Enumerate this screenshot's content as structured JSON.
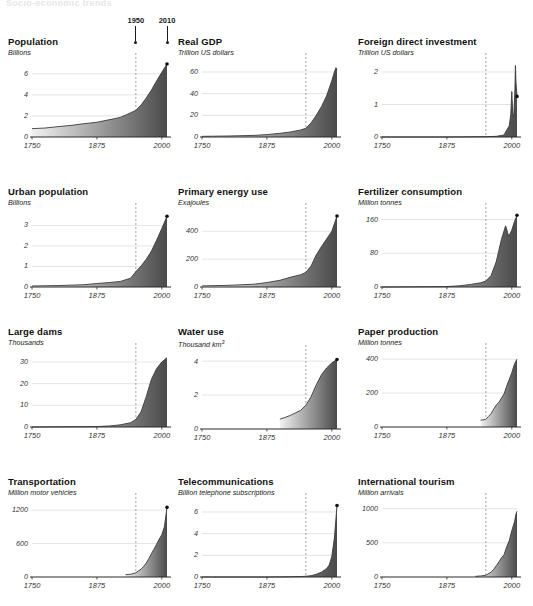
{
  "header": {
    "title": "Socio-economic trends"
  },
  "era_markers": [
    {
      "label": "1950",
      "year": 1950
    },
    {
      "label": "2010",
      "year": 2010
    }
  ],
  "axis": {
    "x_ticks": [
      "1750",
      "1875",
      "2000"
    ],
    "x_tick_values": [
      1750,
      1875,
      2000
    ],
    "x_range": [
      1750,
      2010
    ],
    "dashed_marker_year": 1950
  },
  "chart_data": [
    {
      "type": "area",
      "title": "Population",
      "ylabel": "Billions",
      "xlabel": "",
      "ylim": [
        0,
        7.4
      ],
      "y_ticks": [
        0,
        2,
        4,
        6
      ],
      "y_tick_labels": [
        "0",
        "2",
        "4",
        "6"
      ],
      "xlim": [
        1750,
        2010
      ],
      "x_ticks": [
        1750,
        1875,
        2000
      ],
      "x_tick_labels": [
        "1750",
        "1875",
        "2000"
      ],
      "grid": true,
      "end_dot": true,
      "x": [
        1750,
        1775,
        1800,
        1825,
        1850,
        1875,
        1900,
        1910,
        1920,
        1930,
        1940,
        1950,
        1960,
        1970,
        1980,
        1990,
        2000,
        2010
      ],
      "values": [
        0.79,
        0.85,
        0.98,
        1.1,
        1.26,
        1.4,
        1.65,
        1.75,
        1.86,
        2.07,
        2.3,
        2.53,
        3.03,
        3.7,
        4.45,
        5.32,
        6.14,
        6.93
      ]
    },
    {
      "type": "area",
      "title": "Real GDP",
      "ylabel": "Trillion US dollars",
      "xlabel": "",
      "ylim": [
        0,
        72
      ],
      "y_ticks": [
        0,
        20,
        40,
        60
      ],
      "y_tick_labels": [
        "0",
        "20",
        "40",
        "60"
      ],
      "xlim": [
        1750,
        2010
      ],
      "x_ticks": [
        1750,
        1875,
        2000
      ],
      "x_tick_labels": [
        "1750",
        "1875",
        "2000"
      ],
      "grid": true,
      "end_dot": false,
      "x": [
        1750,
        1800,
        1850,
        1875,
        1900,
        1920,
        1940,
        1950,
        1960,
        1970,
        1980,
        1990,
        2000,
        2005,
        2008,
        2010
      ],
      "values": [
        0.6,
        0.9,
        1.5,
        2.2,
        3.4,
        4.6,
        6.5,
        8.0,
        13.0,
        20.0,
        28.0,
        38.0,
        52.0,
        60.0,
        64.0,
        62.0
      ]
    },
    {
      "type": "area",
      "title": "Foreign direct investment",
      "ylabel": "Trillion US dollars",
      "xlabel": "",
      "ylim": [
        0,
        2.4
      ],
      "y_ticks": [
        0,
        1,
        2
      ],
      "y_tick_labels": [
        "0",
        "1",
        "2"
      ],
      "xlim": [
        1750,
        2010
      ],
      "x_ticks": [
        1750,
        1875,
        2000
      ],
      "x_tick_labels": [
        "1750",
        "1875",
        "2000"
      ],
      "grid": true,
      "end_dot": true,
      "x": [
        1750,
        1875,
        1950,
        1970,
        1980,
        1985,
        1990,
        1995,
        1998,
        2000,
        2002,
        2004,
        2006,
        2007,
        2008,
        2010
      ],
      "values": [
        0,
        0,
        0.01,
        0.02,
        0.05,
        0.06,
        0.21,
        0.34,
        0.69,
        1.4,
        0.62,
        0.73,
        1.46,
        2.2,
        1.7,
        1.25
      ]
    },
    {
      "type": "area",
      "title": "Urban population",
      "ylabel": "Billions",
      "xlabel": "",
      "ylim": [
        0,
        3.8
      ],
      "y_ticks": [
        0,
        1,
        2,
        3
      ],
      "y_tick_labels": [
        "0",
        "1",
        "2",
        "3"
      ],
      "xlim": [
        1750,
        2010
      ],
      "x_ticks": [
        1750,
        1875,
        2000
      ],
      "x_tick_labels": [
        "1750",
        "1875",
        "2000"
      ],
      "grid": true,
      "end_dot": true,
      "x": [
        1750,
        1800,
        1850,
        1875,
        1900,
        1920,
        1940,
        1950,
        1960,
        1970,
        1980,
        1990,
        2000,
        2010
      ],
      "values": [
        0.05,
        0.07,
        0.11,
        0.17,
        0.22,
        0.27,
        0.43,
        0.75,
        1.02,
        1.35,
        1.75,
        2.28,
        2.85,
        3.45
      ]
    },
    {
      "type": "area",
      "title": "Primary energy use",
      "ylabel": "Exajoules",
      "xlabel": "",
      "ylim": [
        0,
        560
      ],
      "y_ticks": [
        0,
        200,
        400
      ],
      "y_tick_labels": [
        "0",
        "200",
        "400"
      ],
      "xlim": [
        1750,
        2010
      ],
      "x_ticks": [
        1750,
        1875,
        2000
      ],
      "x_tick_labels": [
        "1750",
        "1875",
        "2000"
      ],
      "grid": true,
      "end_dot": true,
      "x": [
        1750,
        1800,
        1850,
        1875,
        1900,
        1920,
        1940,
        1950,
        1960,
        1970,
        1980,
        1990,
        2000,
        2005,
        2010
      ],
      "values": [
        8,
        12,
        20,
        32,
        48,
        70,
        88,
        105,
        150,
        230,
        290,
        345,
        400,
        455,
        510
      ]
    },
    {
      "type": "area",
      "title": "Fertilizer consumption",
      "ylabel": "Million tonnes",
      "xlabel": "",
      "ylim": [
        0,
        185
      ],
      "y_ticks": [
        0,
        80,
        160
      ],
      "y_tick_labels": [
        "0",
        "80",
        "160"
      ],
      "xlim": [
        1750,
        2010
      ],
      "x_ticks": [
        1750,
        1875,
        2000
      ],
      "x_tick_labels": [
        "1750",
        "1875",
        "2000"
      ],
      "grid": true,
      "end_dot": true,
      "x": [
        1750,
        1875,
        1900,
        1920,
        1940,
        1950,
        1960,
        1970,
        1980,
        1988,
        1990,
        1994,
        2000,
        2005,
        2010
      ],
      "values": [
        0,
        1,
        3,
        6,
        10,
        14,
        27,
        60,
        113,
        145,
        138,
        120,
        135,
        155,
        170
      ]
    },
    {
      "type": "area",
      "title": "Large dams",
      "ylabel": "Thousands",
      "xlabel": "",
      "ylim": [
        0,
        36
      ],
      "y_ticks": [
        0,
        10,
        20,
        30
      ],
      "y_tick_labels": [
        "0",
        "10",
        "20",
        "30"
      ],
      "xlim": [
        1750,
        2010
      ],
      "x_ticks": [
        1750,
        1875,
        2000
      ],
      "x_tick_labels": [
        "1750",
        "1875",
        "2000"
      ],
      "grid": true,
      "end_dot": false,
      "x": [
        1750,
        1875,
        1900,
        1920,
        1940,
        1950,
        1960,
        1970,
        1980,
        1990,
        2000,
        2010
      ],
      "values": [
        0,
        0.2,
        0.5,
        1.0,
        2.0,
        3.5,
        7.0,
        14.0,
        22.0,
        27.0,
        30.0,
        32.0
      ]
    },
    {
      "type": "area",
      "title": "Water use",
      "ylabel": "Thousand km³",
      "xlabel": "",
      "ylim": [
        0,
        4.6
      ],
      "y_ticks": [
        0,
        2,
        4
      ],
      "y_tick_labels": [
        "0",
        "2",
        "4"
      ],
      "xlim": [
        1750,
        2010
      ],
      "x_ticks": [
        1750,
        1875,
        2000
      ],
      "x_tick_labels": [
        "1750",
        "1875",
        "2000"
      ],
      "grid": true,
      "end_dot": true,
      "x": [
        1900,
        1910,
        1920,
        1930,
        1940,
        1950,
        1960,
        1970,
        1980,
        1990,
        2000,
        2010
      ],
      "values": [
        0.58,
        0.68,
        0.8,
        0.95,
        1.1,
        1.4,
        1.9,
        2.6,
        3.2,
        3.6,
        3.9,
        4.1
      ]
    },
    {
      "type": "area",
      "title": "Paper production",
      "ylabel": "Million tonnes",
      "xlabel": "",
      "ylim": [
        0,
        460
      ],
      "y_ticks": [
        0,
        200,
        400
      ],
      "y_tick_labels": [
        "0",
        "200",
        "400"
      ],
      "xlim": [
        1750,
        2010
      ],
      "x_ticks": [
        1750,
        1875,
        2000
      ],
      "x_tick_labels": [
        "1750",
        "1875",
        "2000"
      ],
      "grid": true,
      "end_dot": false,
      "x": [
        1940,
        1950,
        1955,
        1960,
        1965,
        1970,
        1975,
        1980,
        1985,
        1990,
        1995,
        2000,
        2005,
        2010
      ],
      "values": [
        40,
        45,
        62,
        78,
        105,
        130,
        145,
        170,
        195,
        240,
        280,
        320,
        370,
        400
      ]
    },
    {
      "type": "area",
      "title": "Transportation",
      "ylabel": "Million motor vehicles",
      "xlabel": "",
      "ylim": [
        0,
        1400
      ],
      "y_ticks": [
        0,
        600,
        1200
      ],
      "y_tick_labels": [
        "0",
        "600",
        "1200"
      ],
      "xlim": [
        1750,
        2010
      ],
      "x_ticks": [
        1750,
        1875,
        2000
      ],
      "x_tick_labels": [
        "1750",
        "1875",
        "2000"
      ],
      "grid": true,
      "end_dot": true,
      "x": [
        1930,
        1940,
        1950,
        1955,
        1960,
        1965,
        1970,
        1975,
        1980,
        1985,
        1990,
        1995,
        2000,
        2005,
        2010
      ],
      "values": [
        40,
        50,
        75,
        110,
        140,
        190,
        250,
        330,
        420,
        500,
        590,
        680,
        760,
        900,
        1250
      ]
    },
    {
      "type": "area",
      "title": "Telecommunications",
      "ylabel": "Billion telephone subscriptions",
      "xlabel": "",
      "ylim": [
        0,
        7.2
      ],
      "y_ticks": [
        0,
        2,
        4,
        6
      ],
      "y_tick_labels": [
        "0",
        "2",
        "4",
        "6"
      ],
      "xlim": [
        1750,
        2010
      ],
      "x_ticks": [
        1750,
        1875,
        2000
      ],
      "x_tick_labels": [
        "1750",
        "1875",
        "2000"
      ],
      "grid": true,
      "end_dot": true,
      "x": [
        1750,
        1875,
        1900,
        1920,
        1940,
        1950,
        1960,
        1970,
        1980,
        1990,
        1995,
        2000,
        2005,
        2008,
        2010
      ],
      "values": [
        0,
        0,
        0.01,
        0.02,
        0.04,
        0.07,
        0.12,
        0.25,
        0.45,
        0.78,
        1.1,
        1.9,
        3.6,
        5.4,
        6.6
      ]
    },
    {
      "type": "area",
      "title": "International tourism",
      "ylabel": "Million arrivals",
      "xlabel": "",
      "ylim": [
        0,
        1140
      ],
      "y_ticks": [
        0,
        500,
        1000
      ],
      "y_tick_labels": [
        "0",
        "500",
        "1000"
      ],
      "xlim": [
        1750,
        2010
      ],
      "x_ticks": [
        1750,
        1875,
        2000
      ],
      "x_tick_labels": [
        "1750",
        "1875",
        "2000"
      ],
      "grid": true,
      "end_dot": false,
      "x": [
        1930,
        1940,
        1950,
        1960,
        1965,
        1970,
        1975,
        1980,
        1985,
        1990,
        1995,
        2000,
        2005,
        2008,
        2010
      ],
      "values": [
        10,
        15,
        25,
        70,
        110,
        165,
        220,
        280,
        325,
        440,
        530,
        680,
        800,
        920,
        960
      ]
    }
  ],
  "colors": {
    "ink": "#111111",
    "axis": "#2b2b2b",
    "grid": "#d8d8d8",
    "dashed": "#8a8a8a",
    "fill_light": "#f2f2f2",
    "fill_dark": "#4a4a4a",
    "header_ghost": "#e6e6ea"
  }
}
